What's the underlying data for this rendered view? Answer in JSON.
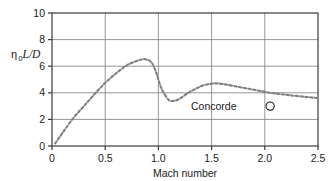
{
  "chart_data": {
    "type": "line",
    "title": "",
    "xlabel": "Mach number",
    "ylabel": "η₀L/D",
    "ylabel_parts": {
      "eta": "η",
      "subscript": "0",
      "italic": "L/D"
    },
    "xlim": [
      0,
      2.5
    ],
    "ylim": [
      0,
      10
    ],
    "xticks": [
      "0",
      "0.5",
      "1.0",
      "1.5",
      "2.0",
      "2.5"
    ],
    "xtick_values": [
      0,
      0.5,
      1.0,
      1.5,
      2.0,
      2.5
    ],
    "yticks": [
      "0",
      "2",
      "4",
      "6",
      "8",
      "10"
    ],
    "ytick_values": [
      0,
      2,
      4,
      6,
      8,
      10
    ],
    "grid": "both",
    "legend": "none",
    "series": [
      {
        "name": "overall efficiency",
        "style": "dashed",
        "color": "#808080",
        "x": [
          0.03,
          0.1,
          0.2,
          0.3,
          0.4,
          0.5,
          0.6,
          0.7,
          0.78,
          0.84,
          0.88,
          0.92,
          0.95,
          0.98,
          1.0,
          1.02,
          1.05,
          1.1,
          1.15,
          1.2,
          1.28,
          1.35,
          1.42,
          1.5,
          1.56,
          1.65,
          1.75,
          1.85,
          1.95,
          2.05,
          2.15,
          2.25,
          2.35,
          2.5
        ],
        "y": [
          0.2,
          1.0,
          2.1,
          3.0,
          3.9,
          4.75,
          5.45,
          6.05,
          6.35,
          6.5,
          6.52,
          6.4,
          6.1,
          5.5,
          5.0,
          4.5,
          4.0,
          3.45,
          3.4,
          3.55,
          4.0,
          4.3,
          4.55,
          4.68,
          4.7,
          4.6,
          4.45,
          4.3,
          4.15,
          4.0,
          3.9,
          3.8,
          3.72,
          3.6
        ]
      }
    ],
    "annotations": [
      {
        "label": "Concorde",
        "marker": "open-circle",
        "x": 2.05,
        "y": 3.0,
        "label_x": 1.52,
        "label_y": 3.0
      }
    ]
  },
  "axis_style": {
    "frame_color": "#3a3a3a",
    "grid_color": "#808080",
    "curve_color": "#8c8c8c",
    "text_color": "#1a1a1a"
  }
}
